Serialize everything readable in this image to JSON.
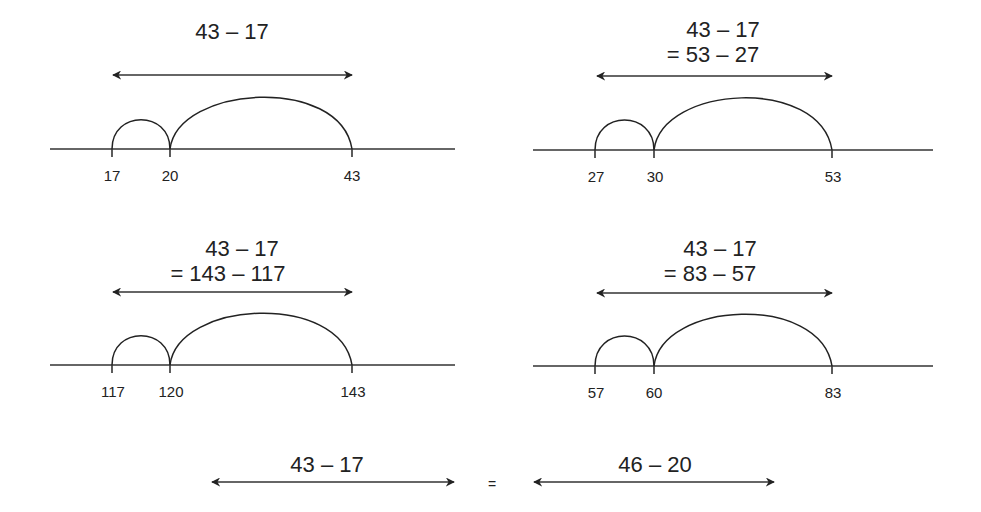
{
  "panels": [
    {
      "id": "p1",
      "expression_line1": "43 – 17",
      "expression_line2": "",
      "points": [
        {
          "value": 17,
          "label": "17"
        },
        {
          "value": 20,
          "label": "20"
        },
        {
          "value": 43,
          "label": "43"
        }
      ],
      "jumps": [
        {
          "from": 17,
          "to": 20,
          "size": 3
        },
        {
          "from": 20,
          "to": 43,
          "size": 23
        }
      ],
      "difference": 26
    },
    {
      "id": "p2",
      "expression_line1": "43 – 17",
      "expression_line2": "= 53 – 27",
      "points": [
        {
          "value": 27,
          "label": "27"
        },
        {
          "value": 30,
          "label": "30"
        },
        {
          "value": 53,
          "label": "53"
        }
      ],
      "jumps": [
        {
          "from": 27,
          "to": 30,
          "size": 3
        },
        {
          "from": 30,
          "to": 53,
          "size": 23
        }
      ],
      "difference": 26
    },
    {
      "id": "p3",
      "expression_line1": "43 – 17",
      "expression_line2": "= 143 – 117",
      "points": [
        {
          "value": 117,
          "label": "117"
        },
        {
          "value": 120,
          "label": "120"
        },
        {
          "value": 143,
          "label": "143"
        }
      ],
      "jumps": [
        {
          "from": 117,
          "to": 120,
          "size": 3
        },
        {
          "from": 120,
          "to": 143,
          "size": 23
        }
      ],
      "difference": 26
    },
    {
      "id": "p4",
      "expression_line1": "43 – 17",
      "expression_line2": "= 83 – 57",
      "points": [
        {
          "value": 57,
          "label": "57"
        },
        {
          "value": 60,
          "label": "60"
        },
        {
          "value": 83,
          "label": "83"
        }
      ],
      "jumps": [
        {
          "from": 57,
          "to": 60,
          "size": 3
        },
        {
          "from": 60,
          "to": 83,
          "size": 23
        }
      ],
      "difference": 26
    }
  ],
  "bottom": {
    "left_label": "43 – 17",
    "equals": "=",
    "right_label": "46 – 20"
  },
  "colors": {
    "ink": "#222222",
    "background": "#ffffff"
  }
}
